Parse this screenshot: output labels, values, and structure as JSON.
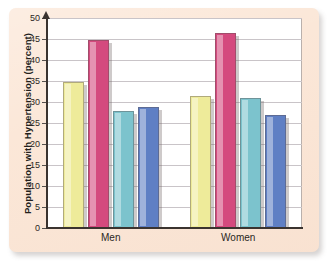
{
  "chart_data": {
    "type": "bar",
    "title": "",
    "subtitle": "",
    "xlabel": "",
    "ylabel": "Population with Hypertension (percent)",
    "categories": [
      "Men",
      "Women"
    ],
    "ylim": [
      0,
      50
    ],
    "yticks": [
      0,
      5,
      10,
      15,
      20,
      25,
      30,
      35,
      40,
      45,
      50
    ],
    "ytick_labels": [
      "0",
      "5",
      "10",
      "15",
      "20",
      "25",
      "30",
      "35",
      "40",
      "45",
      "50"
    ],
    "grid": true,
    "legend": "none",
    "series": [
      {
        "name": "series-1",
        "color": "#eeeb9a",
        "values": [
          34.8,
          31.5
        ]
      },
      {
        "name": "series-2",
        "color": "#d44a7e",
        "values": [
          44.8,
          46.5
        ]
      },
      {
        "name": "series-3",
        "color": "#7cc3cd",
        "values": [
          27.8,
          31.0
        ]
      },
      {
        "name": "series-4",
        "color": "#5f7fc4",
        "values": [
          28.9,
          27.0
        ]
      }
    ]
  },
  "figure": {
    "panel_color": "#fbe6d6",
    "plot_background": "#ffffff",
    "grid_color": "#c9c4c8",
    "axis_color": "#3a332f"
  }
}
